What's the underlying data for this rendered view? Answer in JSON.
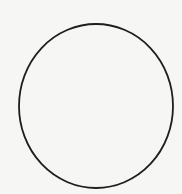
{
  "canvas": {
    "width": 182,
    "height": 194,
    "background": "#f6f6f5"
  },
  "shapes": [
    {
      "type": "ellipse",
      "cx": 96,
      "cy": 106,
      "rx": 77,
      "ry": 82,
      "stroke": "#1e1e1e",
      "stroke_width": 1.8,
      "fill": "none"
    }
  ]
}
